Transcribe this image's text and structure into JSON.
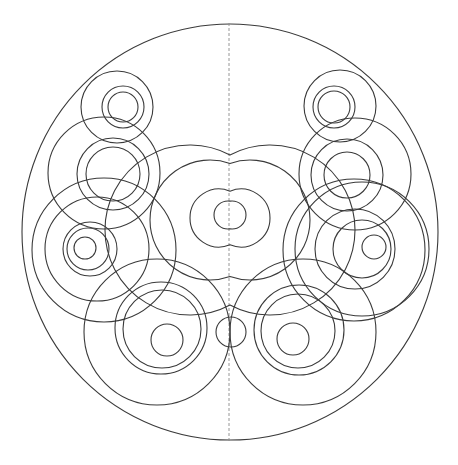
{
  "diagram": {
    "stroke_color": "#3a3a3a",
    "axis_color": "#8a8a8a",
    "background_color": "#ffffff",
    "elements": {
      "boundary": {
        "name": "outer-boundary-circle",
        "cx": 230,
        "cy": 232,
        "r": 208
      },
      "axis": {
        "name": "symmetry-axis",
        "x": 229,
        "y1": 23,
        "y2": 441
      },
      "circles": [
        {
          "name": "top-left-outer-ring",
          "cx": 117,
          "cy": 107,
          "r": 36
        },
        {
          "name": "top-left-middle-ring",
          "cx": 123,
          "cy": 107,
          "r": 21
        },
        {
          "name": "top-left-inner-ring",
          "cx": 123,
          "cy": 107,
          "r": 15
        },
        {
          "name": "top-right-outer-ring",
          "cx": 340,
          "cy": 106,
          "r": 36
        },
        {
          "name": "top-right-middle-ring",
          "cx": 334,
          "cy": 107,
          "r": 21
        },
        {
          "name": "top-right-inner-ring",
          "cx": 334,
          "cy": 107,
          "r": 16
        },
        {
          "name": "upper-left-large-ring",
          "cx": 104,
          "cy": 173,
          "r": 56
        },
        {
          "name": "upper-left-middle-ring",
          "cx": 113,
          "cy": 174,
          "r": 36
        },
        {
          "name": "upper-left-inner-ring",
          "cx": 113,
          "cy": 174,
          "r": 27
        },
        {
          "name": "upper-right-large-ring",
          "cx": 355,
          "cy": 174,
          "r": 56
        },
        {
          "name": "upper-right-middle-ring",
          "cx": 347,
          "cy": 175,
          "r": 36
        },
        {
          "name": "upper-right-inner-ring",
          "cx": 347,
          "cy": 175,
          "r": 23
        },
        {
          "name": "mid-left-inner-ring",
          "cx": 85,
          "cy": 248,
          "r": 11
        },
        {
          "name": "mid-left-ring-2",
          "cx": 88,
          "cy": 249,
          "r": 21
        },
        {
          "name": "mid-left-ring-3",
          "cx": 90,
          "cy": 249,
          "r": 27
        },
        {
          "name": "mid-left-ring-4",
          "cx": 97,
          "cy": 249,
          "r": 52
        },
        {
          "name": "mid-left-ring-5",
          "cx": 104,
          "cy": 250,
          "r": 72
        },
        {
          "name": "mid-right-inner-ring",
          "cx": 374,
          "cy": 247,
          "r": 12
        },
        {
          "name": "mid-right-ring-2",
          "cx": 362,
          "cy": 249,
          "r": 29
        },
        {
          "name": "mid-right-ring-3",
          "cx": 355,
          "cy": 249,
          "r": 40
        },
        {
          "name": "mid-right-ring-4",
          "cx": 362,
          "cy": 249,
          "r": 67
        },
        {
          "name": "mid-right-ring-5",
          "cx": 354,
          "cy": 250,
          "r": 71
        },
        {
          "name": "bottom-left-inner-ring",
          "cx": 167,
          "cy": 340,
          "r": 16
        },
        {
          "name": "bottom-left-ring-2",
          "cx": 162,
          "cy": 329,
          "r": 39
        },
        {
          "name": "bottom-left-ring-3",
          "cx": 161,
          "cy": 328,
          "r": 46
        },
        {
          "name": "bottom-left-large-ring",
          "cx": 157,
          "cy": 332,
          "r": 73
        },
        {
          "name": "bottom-right-inner-ring",
          "cx": 293,
          "cy": 339,
          "r": 16
        },
        {
          "name": "bottom-right-ring-2",
          "cx": 298,
          "cy": 331,
          "r": 37
        },
        {
          "name": "bottom-right-ring-3",
          "cx": 299,
          "cy": 330,
          "r": 45
        },
        {
          "name": "bottom-right-large-ring",
          "cx": 303,
          "cy": 332,
          "r": 73
        },
        {
          "name": "bottom-center-small-ring",
          "cx": 231,
          "cy": 332,
          "r": 15
        }
      ],
      "lobed_shapes": [
        {
          "name": "center-inner-lobed-ring",
          "cy": 215,
          "left_cx": 228,
          "right_cx": 232,
          "r": 14
        },
        {
          "name": "center-second-lobed-ring",
          "cy": 218,
          "left_cx": 219,
          "right_cx": 241,
          "r": 29
        },
        {
          "name": "center-third-lobed-ring",
          "cy": 220,
          "left_cx": 210,
          "right_cx": 250,
          "r": 60
        },
        {
          "name": "center-outer-lobed-ring",
          "cy": 230,
          "left_cx": 190,
          "right_cx": 270,
          "r": 85
        }
      ]
    }
  }
}
